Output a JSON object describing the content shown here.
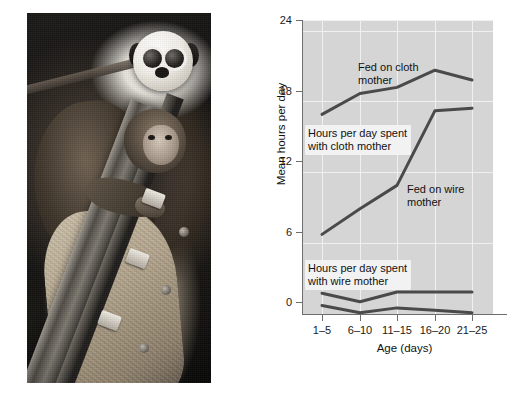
{
  "figure": {
    "photo": {
      "caption_alt": "Infant rhesus monkey clinging to cloth surrogate mother",
      "subject": "harlow-surrogate-mother-experiment"
    }
  },
  "chart_data": {
    "type": "line",
    "title": "",
    "xlabel": "Age (days)",
    "ylabel": "Mean hours per day",
    "categories": [
      "1–5",
      "6–10",
      "11–15",
      "16–20",
      "21–25"
    ],
    "ylim": [
      0,
      24
    ],
    "yticks": [
      0,
      6,
      12,
      18,
      24
    ],
    "ytick_labels": [
      "0",
      "6",
      "12",
      "18",
      "24"
    ],
    "grid": true,
    "legend_position": "inline-annotations",
    "series": [
      {
        "name": "Fed on cloth mother",
        "measure": "Hours per day spent with cloth mother",
        "values": [
          16.3,
          18.0,
          18.5,
          19.9,
          19.1
        ]
      },
      {
        "name": "Fed on wire mother",
        "measure": "Hours per day spent with cloth mother",
        "values": [
          6.5,
          8.6,
          10.5,
          16.6,
          16.8
        ]
      },
      {
        "name": "Fed on cloth mother",
        "measure": "Hours per day spent with wire mother",
        "values": [
          0.7,
          0.1,
          0.5,
          0.3,
          0.1
        ]
      },
      {
        "name": "Fed on wire mother",
        "measure": "Hours per day spent with wire mother",
        "values": [
          1.7,
          1.0,
          1.8,
          1.8,
          1.8
        ]
      }
    ],
    "annotations": [
      {
        "id": "fed-cloth",
        "text": "Fed on cloth\nmother"
      },
      {
        "id": "hours-cloth-mother",
        "text": "Hours per day spent\nwith cloth mother"
      },
      {
        "id": "fed-wire",
        "text": "Fed on wire\nmother"
      },
      {
        "id": "hours-wire-mother",
        "text": "Hours per day spent\nwith wire mother"
      }
    ],
    "colors": {
      "plot_background": "#d5d5d5",
      "grid": "#f0f0f0",
      "axis": "#6e6e6e",
      "line": "#4a4a4a",
      "text": "#111111",
      "annotation_background": "#f2f2f2"
    }
  }
}
